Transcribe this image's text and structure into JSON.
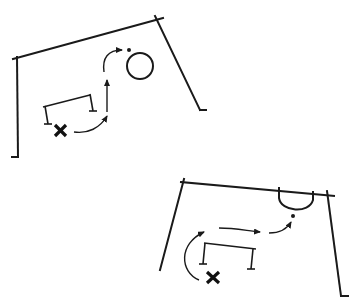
{
  "figure": {
    "description": "Two schematic soccer/handball drill diagrams: a player (X) runs around a hurdle and follows a curved dashed path toward the goal",
    "colors": {
      "ink": "#1a1a1a",
      "background": "#ffffff"
    }
  },
  "diagrams": [
    {
      "id": "top-left",
      "elements": {
        "goal_frame": "field-outline",
        "target": "circle",
        "ball_marker": "dot",
        "obstacle": "hurdle",
        "player": "X",
        "path": "curved-arrow-run"
      }
    },
    {
      "id": "bottom-right",
      "elements": {
        "goal_frame": "field-outline",
        "target": "goal-area-arc",
        "ball_marker": "dot",
        "obstacle": "hurdle",
        "player": "X",
        "path": "curved-arrow-run"
      }
    }
  ],
  "labels": {
    "player_symbol": "✖"
  }
}
